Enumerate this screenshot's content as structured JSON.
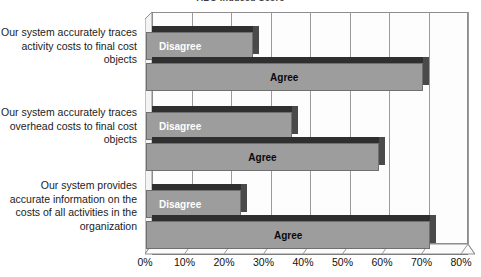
{
  "chart_data": {
    "type": "bar",
    "orientation": "horizontal",
    "stacked": false,
    "title": "ABC-Induced Score",
    "xlabel": "",
    "ylabel": "",
    "xlim": [
      0,
      80
    ],
    "xtick_labels": [
      "0%",
      "10%",
      "20%",
      "30%",
      "40%",
      "50%",
      "60%",
      "70%",
      "80%"
    ],
    "xtick_values": [
      0,
      10,
      20,
      30,
      40,
      50,
      60,
      70,
      80
    ],
    "grid": true,
    "legend_position": "none",
    "categories": [
      "Our system accurately traces activity costs to final cost objects",
      "Our system accurately traces overhead costs to final cost objects",
      "Our system provides accurate information on the costs of all activities in the organization"
    ],
    "series": [
      {
        "name": "Disagree",
        "values": [
          27,
          37,
          24
        ],
        "label_color": "#ffffff",
        "bar_color": "#9d9d9d"
      },
      {
        "name": "Agree",
        "values": [
          70,
          59,
          72
        ],
        "label_color": "#0a0a0a",
        "bar_color": "#9d9d9d"
      }
    ]
  },
  "labels": {
    "disagree": "Disagree",
    "agree": "Agree"
  }
}
